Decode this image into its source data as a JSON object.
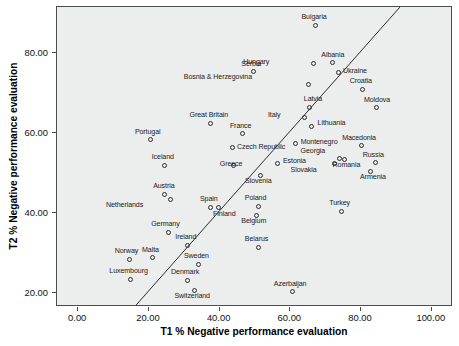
{
  "chart_data": {
    "type": "scatter",
    "title": "",
    "xlabel": "T1 % Negative performance evaluation",
    "ylabel": "T2 % Negative performance evaluation",
    "xlim": [
      -6,
      106
    ],
    "ylim": [
      16.5,
      91.5
    ],
    "xticks": [
      0,
      20,
      40,
      60,
      80,
      100
    ],
    "xticklabels": [
      "0.00",
      "20.00",
      "40.00",
      "60.00",
      "80.00",
      "100.00"
    ],
    "yticks": [
      20,
      40,
      60,
      80
    ],
    "yticklabels": [
      "20.00",
      "40.00",
      "60.00",
      "80.00"
    ],
    "grid": false,
    "legend": "none",
    "annotations": [
      "diagonal reference line y = x"
    ],
    "reference_line": {
      "type": "identity",
      "from": [
        -6,
        16.5
      ],
      "to": [
        91.5,
        91.5
      ]
    },
    "marker": {
      "shape": "open-circle",
      "color": "#2b2b2b",
      "size": 5
    },
    "plot_background": "#eceded",
    "points": [
      {
        "label": "Bulgaria",
        "x": 67.0,
        "y": 86.9,
        "lx": -1,
        "ly": -11
      },
      {
        "label": "Albania",
        "x": 72.0,
        "y": 77.6,
        "lx": 0,
        "ly": -11
      },
      {
        "label": "Hungary",
        "x": 66.5,
        "y": 77.4,
        "lx": -44,
        "ly": -4
      },
      {
        "label": "Serbia",
        "x": 49.5,
        "y": 75.3,
        "lx": -2,
        "ly": -11
      },
      {
        "label": "Ukraine",
        "x": 73.5,
        "y": 75.2,
        "lx": 5,
        "ly": -4
      },
      {
        "label": "Bosnia & Herzegovina",
        "x": 65.0,
        "y": 72.1,
        "lx": -56,
        "ly": -11
      },
      {
        "label": "Croatia",
        "x": 80.5,
        "y": 71.0,
        "lx": -2,
        "ly": -11
      },
      {
        "label": "Latvia",
        "x": 65.5,
        "y": 66.5,
        "lx": -6,
        "ly": -11
      },
      {
        "label": "Moldova",
        "x": 84.5,
        "y": 66.3,
        "lx": 0,
        "ly": -11
      },
      {
        "label": "Italy",
        "x": 64.0,
        "y": 63.8,
        "lx": -24,
        "ly": -6
      },
      {
        "label": "Great Britain",
        "x": 37.5,
        "y": 62.5,
        "lx": -2,
        "ly": -11
      },
      {
        "label": "Lithuania",
        "x": 66.0,
        "y": 61.6,
        "lx": 6,
        "ly": -7
      },
      {
        "label": "France",
        "x": 46.5,
        "y": 59.8,
        "lx": -2,
        "ly": -11
      },
      {
        "label": "Portugal",
        "x": 20.5,
        "y": 58.3,
        "lx": -3,
        "ly": -11
      },
      {
        "label": "Montenegro",
        "x": 61.5,
        "y": 57.5,
        "lx": 5,
        "ly": -4
      },
      {
        "label": "Macedonia",
        "x": 80.0,
        "y": 56.8,
        "lx": -2,
        "ly": -11
      },
      {
        "label": "Czech Republic",
        "x": 43.5,
        "y": 56.3,
        "lx": 5,
        "ly": -4
      },
      {
        "label": "Georgia",
        "x": 73.8,
        "y": 53.6,
        "lx": -14,
        "ly": -11
      },
      {
        "label": "Romania",
        "x": 75.3,
        "y": 53.4,
        "lx": 2,
        "ly": 3
      },
      {
        "label": "Russia",
        "x": 84.0,
        "y": 52.6,
        "lx": -2,
        "ly": -11
      },
      {
        "label": "Estonia",
        "x": 56.5,
        "y": 52.3,
        "lx": 5,
        "ly": -6
      },
      {
        "label": "Iceland",
        "x": 24.5,
        "y": 52.0,
        "lx": -2,
        "ly": -11
      },
      {
        "label": "Greece",
        "x": 43.8,
        "y": 52.0,
        "lx": -2,
        "ly": -4
      },
      {
        "label": "Slovakia",
        "x": 72.5,
        "y": 52.3,
        "lx": -18,
        "ly": 3
      },
      {
        "label": "Armenia",
        "x": 82.8,
        "y": 50.4,
        "lx": 2,
        "ly": 3
      },
      {
        "label": "Slovenia",
        "x": 51.5,
        "y": 49.5,
        "lx": -2,
        "ly": 3
      },
      {
        "label": "Austria",
        "x": 24.5,
        "y": 44.7,
        "lx": -1,
        "ly": -11
      },
      {
        "label": "Netherlands",
        "x": 26.0,
        "y": 43.5,
        "lx": -27,
        "ly": 3
      },
      {
        "label": "Poland",
        "x": 51.0,
        "y": 41.7,
        "lx": -3,
        "ly": -11
      },
      {
        "label": "Spain",
        "x": 37.5,
        "y": 41.5,
        "lx": -2,
        "ly": -11
      },
      {
        "label": "Finland",
        "x": 39.8,
        "y": 41.3,
        "lx": -6,
        "ly": 3
      },
      {
        "label": "Turkey",
        "x": 74.5,
        "y": 40.5,
        "lx": -2,
        "ly": -11
      },
      {
        "label": "Belgium",
        "x": 50.5,
        "y": 39.5,
        "lx": -3,
        "ly": 3
      },
      {
        "label": "Germany",
        "x": 25.5,
        "y": 35.2,
        "lx": -3,
        "ly": -11
      },
      {
        "label": "Ireland",
        "x": 31.0,
        "y": 31.9,
        "lx": -2,
        "ly": -11
      },
      {
        "label": "Belarus",
        "x": 51.0,
        "y": 31.4,
        "lx": -2,
        "ly": -11
      },
      {
        "label": "Malta",
        "x": 21.0,
        "y": 28.8,
        "lx": -2,
        "ly": -11
      },
      {
        "label": "Norway",
        "x": 14.5,
        "y": 28.4,
        "lx": -3,
        "ly": -11
      },
      {
        "label": "Sweden",
        "x": 34.0,
        "y": 27.2,
        "lx": -2,
        "ly": -11
      },
      {
        "label": "Luxembourg",
        "x": 14.8,
        "y": 23.4,
        "lx": -2,
        "ly": -11
      },
      {
        "label": "Denmark",
        "x": 30.8,
        "y": 23.2,
        "lx": -2,
        "ly": -11
      },
      {
        "label": "Azerbaijan",
        "x": 60.5,
        "y": 20.3,
        "lx": -2,
        "ly": -11
      },
      {
        "label": "Switzerland",
        "x": 32.8,
        "y": 20.7,
        "lx": -2,
        "ly": 3
      }
    ]
  }
}
